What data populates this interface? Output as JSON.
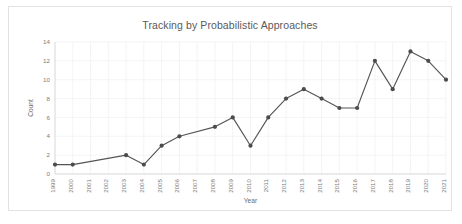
{
  "chart_data": {
    "type": "line",
    "title": "Tracking by Probabilistic Approaches",
    "xlabel": "Year",
    "ylabel": "Count",
    "categories": [
      "1999",
      "2000",
      "2001",
      "2002",
      "2003",
      "2004",
      "2005",
      "2006",
      "2007",
      "2008",
      "2009",
      "2010",
      "2011",
      "2012",
      "2013",
      "2014",
      "2015",
      "2016",
      "2017",
      "2018",
      "2019",
      "2020",
      "2021"
    ],
    "values": [
      1,
      1,
      null,
      null,
      2,
      1,
      3,
      4,
      null,
      5,
      6,
      3,
      6,
      8,
      9,
      8,
      7,
      7,
      12,
      9,
      13,
      12,
      10
    ],
    "x": [
      1999,
      2000,
      2003,
      2004,
      2005,
      2006,
      2008,
      2009,
      2010,
      2011,
      2012,
      2013,
      2014,
      2015,
      2016,
      2017,
      2018,
      2019,
      2020,
      2021
    ],
    "y": [
      1,
      1,
      2,
      1,
      3,
      4,
      5,
      6,
      3,
      6,
      8,
      9,
      8,
      7,
      7,
      12,
      9,
      13,
      12,
      10
    ],
    "ylim": [
      0,
      14
    ],
    "ytick_labels": [
      "0",
      "2",
      "4",
      "6",
      "8",
      "10",
      "12",
      "14"
    ],
    "ytick_values": [
      0,
      2,
      4,
      6,
      8,
      10,
      12,
      14
    ],
    "xlim": [
      1999,
      2021
    ],
    "grid": true,
    "legend": false,
    "series_color": "#555555",
    "marker_color": "#4c4c4c",
    "grid_color": "#efefef",
    "axis_color": "#d6d6d6",
    "text_color": "#7a7a7a",
    "title_color": "#5a5a5a",
    "background": "#ffffff",
    "border_color": "#e2e2e2",
    "marker": "circle",
    "markers_present_years": [
      1999,
      2000,
      2003,
      2004,
      2005,
      2006,
      2008,
      2009,
      2010,
      2011,
      2012,
      2013,
      2014,
      2015,
      2016,
      2017,
      2018,
      2019,
      2020,
      2021
    ],
    "markers_absent_years": [
      2001,
      2002,
      2007
    ]
  }
}
